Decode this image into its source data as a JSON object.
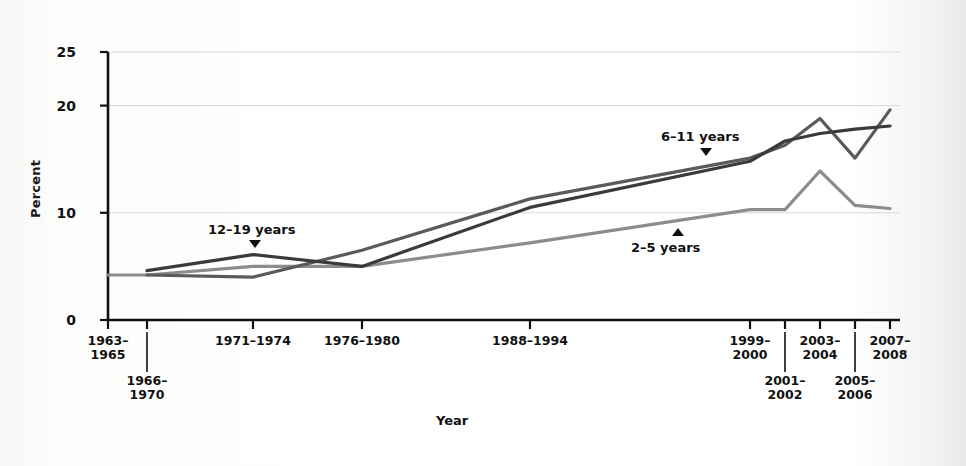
{
  "chart_data": {
    "type": "line",
    "title": "",
    "xlabel": "Year",
    "ylabel": "Percent",
    "ylim": [
      0,
      25
    ],
    "yticks": [
      0,
      10,
      20,
      25
    ],
    "grid": "horizontal",
    "legend_position": "inline-annotations",
    "categories": [
      "1963–\n1965",
      "1966–\n1970",
      "1971–1974",
      "1976–1980",
      "1988–1994",
      "1999–\n2000",
      "2001–\n2002",
      "2003–\n2004",
      "2005–\n2006",
      "2007–\n2008"
    ],
    "categories_plain": [
      "1963-1965",
      "1966-1970",
      "1971-1974",
      "1976-1980",
      "1988-1994",
      "1999-2000",
      "2001-2002",
      "2003-2004",
      "2005-2006",
      "2007-2008"
    ],
    "series": [
      {
        "name": "2–5 years",
        "color": "#8c8c8c",
        "values": [
          4.2,
          4.2,
          5.0,
          5.0,
          7.2,
          10.3,
          10.3,
          13.9,
          10.7,
          10.4
        ]
      },
      {
        "name": "6–11 years",
        "color": "#5a5a5a",
        "values": [
          null,
          4.2,
          4.0,
          6.5,
          11.3,
          15.1,
          16.3,
          18.8,
          15.1,
          19.6
        ]
      },
      {
        "name": "12–19 years",
        "color": "#3a3a3a",
        "values": [
          null,
          4.6,
          6.1,
          5.0,
          10.5,
          14.8,
          16.7,
          17.4,
          17.8,
          18.1
        ]
      }
    ],
    "annotations": [
      {
        "text": "12–19 years",
        "pointer": "down",
        "target_series": "12–19 years",
        "at_category": "1971–1974"
      },
      {
        "text": "6–11 years",
        "pointer": "down",
        "target_series": "6–11 years",
        "at_category": "between 1988–1994 and 1999–2000"
      },
      {
        "text": "2–5 years",
        "pointer": "up",
        "target_series": "2–5 years",
        "at_category": "between 1988–1994 and 1999–2000"
      }
    ]
  },
  "axes": {
    "y_title": "Percent",
    "x_title": "Year",
    "y_tick_labels": [
      "25",
      "20",
      "10",
      "0"
    ]
  },
  "x_axis_labels": [
    {
      "line1": "1963–",
      "line2": "1965",
      "row": "upper"
    },
    {
      "line1": "1966–",
      "line2": "1970",
      "row": "lower"
    },
    {
      "line1": "1971–1974",
      "line2": "",
      "row": "upper"
    },
    {
      "line1": "1976–1980",
      "line2": "",
      "row": "upper"
    },
    {
      "line1": "1988–1994",
      "line2": "",
      "row": "upper"
    },
    {
      "line1": "1999–",
      "line2": "2000",
      "row": "upper"
    },
    {
      "line1": "2001–",
      "line2": "2002",
      "row": "lower"
    },
    {
      "line1": "2003–",
      "line2": "2004",
      "row": "upper"
    },
    {
      "line1": "2005–",
      "line2": "2006",
      "row": "lower"
    },
    {
      "line1": "2007–",
      "line2": "2008",
      "row": "upper"
    }
  ],
  "series_labels": {
    "teen": "12–19 years",
    "child": "6–11 years",
    "preschool": "2–5 years"
  },
  "colors": {
    "axis": "#111111",
    "grid": "#d8d8d8",
    "series_2_5": "#8c8c8c",
    "series_6_11": "#5a5a5a",
    "series_12_19": "#3a3a3a",
    "background": "#ffffff"
  }
}
